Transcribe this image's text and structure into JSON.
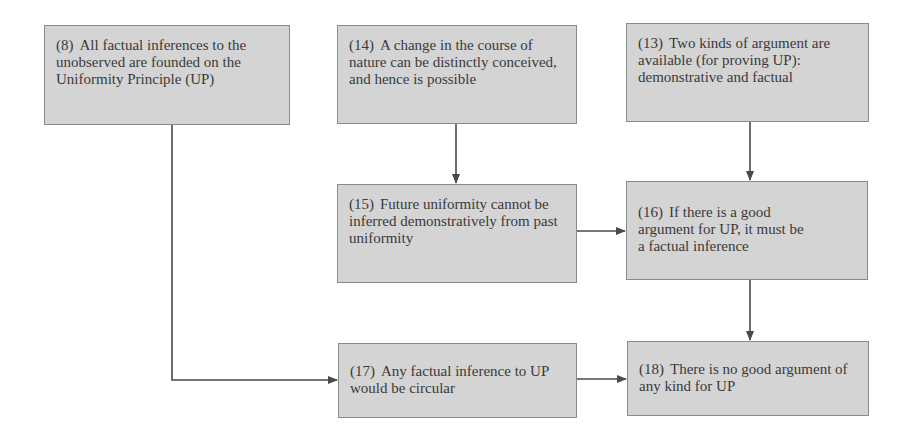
{
  "diagram": {
    "colors": {
      "box_fill": "#d4d4d4",
      "box_border": "#8a8a8a",
      "text": "#3a3a3a",
      "arrow": "#4a4a4a"
    },
    "nodes": {
      "n8": {
        "num": "(8)",
        "text": "All factual inferences to the unobserved are founded on the Uniformity Principle (UP)"
      },
      "n14": {
        "num": "(14)",
        "text": "A change in the course of nature can be distinctly conceived, and hence is possible"
      },
      "n13": {
        "num": "(13)",
        "text": "Two kinds of argument are available (for proving UP): demonstrative and factual"
      },
      "n15": {
        "num": "(15)",
        "text": "Future uniformity cannot be inferred demonstratively from past uniformity"
      },
      "n16": {
        "num": "(16)",
        "text": "If there is a good argument for UP, it must be a factual inference"
      },
      "n17": {
        "num": "(17)",
        "text": "Any factual inference to UP would be circular"
      },
      "n18": {
        "num": "(18)",
        "text": "There is no good argument of any kind for UP"
      }
    },
    "edges": [
      {
        "from": "8",
        "to": "17"
      },
      {
        "from": "14",
        "to": "15"
      },
      {
        "from": "13",
        "to": "16"
      },
      {
        "from": "15",
        "to": "16"
      },
      {
        "from": "16",
        "to": "18"
      },
      {
        "from": "17",
        "to": "18"
      }
    ]
  }
}
